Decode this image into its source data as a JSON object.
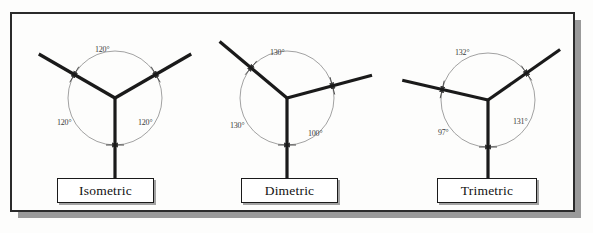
{
  "figure": {
    "background_color": "#fdfdfc",
    "frame_border_color": "#2b2b2b",
    "frame_shadow_color": "#9a9a9a",
    "axis_color": "#1a1a1a",
    "arc_color": "#8a8a8a",
    "text_color": "#3b3b3b",
    "degree_symbol": "°"
  },
  "diagrams": [
    {
      "id": "isometric",
      "name": "Isometric",
      "label": "Isometric",
      "center": {
        "x": 115,
        "y": 98
      },
      "arc_radius": 47,
      "axes": [
        {
          "name": "left-axis",
          "angle_deg": 210,
          "length": 88
        },
        {
          "name": "right-axis",
          "angle_deg": 330,
          "length": 88
        },
        {
          "name": "vertical-axis",
          "angle_deg": 90,
          "length": 85
        }
      ],
      "angles": [
        {
          "name": "top-angle",
          "value": "120",
          "unit": "°",
          "text": "120°",
          "x": 95,
          "y": 45
        },
        {
          "name": "left-angle",
          "value": "120",
          "unit": "°",
          "text": "120°",
          "x": 57,
          "y": 118
        },
        {
          "name": "right-angle",
          "value": "120",
          "unit": "°",
          "text": "120°",
          "x": 138,
          "y": 118
        }
      ],
      "label_box": {
        "x": 57,
        "y": 178,
        "width": 97,
        "height": 25
      }
    },
    {
      "id": "dimetric",
      "name": "Dimetric",
      "label": "Dimetric",
      "center": {
        "x": 287,
        "y": 98
      },
      "arc_radius": 47,
      "axes": [
        {
          "name": "left-axis",
          "angle_deg": 220,
          "length": 88
        },
        {
          "name": "right-axis",
          "angle_deg": 345,
          "length": 88
        },
        {
          "name": "vertical-axis",
          "angle_deg": 90,
          "length": 85
        }
      ],
      "angles": [
        {
          "name": "top-angle",
          "value": "130",
          "unit": "°",
          "text": "130°",
          "x": 270,
          "y": 48
        },
        {
          "name": "left-angle",
          "value": "130",
          "unit": "°",
          "text": "130°",
          "x": 230,
          "y": 121
        },
        {
          "name": "right-angle",
          "value": "100",
          "unit": "°",
          "text": "100°",
          "x": 308,
          "y": 129
        }
      ],
      "label_box": {
        "x": 241,
        "y": 178,
        "width": 97,
        "height": 25
      }
    },
    {
      "id": "trimetric",
      "name": "Trimetric",
      "label": "Trimetric",
      "center": {
        "x": 488,
        "y": 100
      },
      "arc_radius": 47,
      "axes": [
        {
          "name": "left-axis",
          "angle_deg": 193,
          "length": 88
        },
        {
          "name": "right-axis",
          "angle_deg": 325,
          "length": 88
        },
        {
          "name": "vertical-axis",
          "angle_deg": 90,
          "length": 83
        }
      ],
      "angles": [
        {
          "name": "top-angle",
          "value": "132",
          "unit": "°",
          "text": "132°",
          "x": 455,
          "y": 48
        },
        {
          "name": "left-angle",
          "value": "97",
          "unit": "°",
          "text": "97°",
          "x": 438,
          "y": 128
        },
        {
          "name": "right-angle",
          "value": "131",
          "unit": "°",
          "text": "131°",
          "x": 513,
          "y": 117
        }
      ],
      "label_box": {
        "x": 437,
        "y": 178,
        "width": 100,
        "height": 25
      }
    }
  ],
  "frame": {
    "x": 11,
    "y": 13,
    "width": 563,
    "height": 198,
    "shadow_offset": 7
  }
}
